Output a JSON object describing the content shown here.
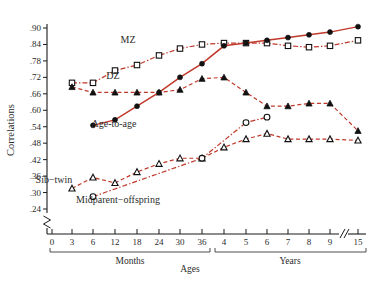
{
  "chart_data": {
    "type": "line",
    "title": "",
    "xlabel": "Ages",
    "ylabel": "Correlations",
    "ylim": [
      0.24,
      0.9
    ],
    "yticks": [
      ".24",
      ".30",
      ".36",
      ".42",
      ".48",
      ".54",
      ".60",
      ".66",
      ".72",
      ".78",
      ".84",
      ".90"
    ],
    "ytick_values": [
      0.24,
      0.3,
      0.36,
      0.42,
      0.48,
      0.54,
      0.6,
      0.66,
      0.72,
      0.78,
      0.84,
      0.9
    ],
    "y_axis_break": true,
    "x_axis_break_before_last": true,
    "grid": false,
    "legend_position": "inline-annotations",
    "xticks": [
      "0",
      "3",
      "6",
      "12",
      "18",
      "24",
      "30",
      "36",
      "4",
      "5",
      "6",
      "7",
      "8",
      "9",
      "15"
    ],
    "x_groups": [
      {
        "label": "Months",
        "ticks": [
          "0",
          "3",
          "6",
          "12",
          "18",
          "24",
          "30",
          "36"
        ]
      },
      {
        "label": "Years",
        "ticks": [
          "4",
          "5",
          "6",
          "7",
          "8",
          "9",
          "15"
        ]
      }
    ],
    "series": [
      {
        "name": "MZ",
        "marker": "open-square",
        "linestyle": "dash-dot",
        "color": "#c0392b",
        "x": [
          "3",
          "6",
          "12",
          "18",
          "24",
          "30",
          "36",
          "4",
          "5",
          "6",
          "7",
          "8",
          "9",
          "15"
        ],
        "values": [
          0.7,
          0.7,
          0.745,
          0.765,
          0.8,
          0.825,
          0.84,
          0.845,
          0.845,
          0.845,
          0.835,
          0.83,
          0.835,
          0.855
        ]
      },
      {
        "name": "DZ",
        "marker": "filled-triangle",
        "linestyle": "dashed",
        "color": "#c0392b",
        "x": [
          "3",
          "6",
          "12",
          "18",
          "24",
          "30",
          "36",
          "4",
          "5",
          "6",
          "7",
          "8",
          "9",
          "15"
        ],
        "values": [
          0.685,
          0.665,
          0.665,
          0.665,
          0.665,
          0.675,
          0.715,
          0.72,
          0.665,
          0.615,
          0.615,
          0.625,
          0.625,
          0.525
        ]
      },
      {
        "name": "Age-to-age",
        "marker": "filled-circle",
        "linestyle": "solid",
        "color": "#c0392b",
        "x": [
          "6",
          "12",
          "18",
          "24",
          "30",
          "36",
          "4",
          "5",
          "6",
          "7",
          "8",
          "9",
          "15"
        ],
        "values": [
          0.545,
          0.565,
          0.615,
          0.665,
          0.72,
          0.77,
          0.835,
          0.845,
          0.855,
          0.865,
          0.875,
          0.885,
          0.905
        ]
      },
      {
        "name": "Sib-twin",
        "marker": "open-triangle",
        "linestyle": "dashed",
        "color": "#c0392b",
        "x": [
          "3",
          "6",
          "12",
          "18",
          "24",
          "30",
          "36",
          "4",
          "5",
          "6",
          "7",
          "8",
          "9",
          "15"
        ],
        "values": [
          0.315,
          0.355,
          0.335,
          0.375,
          0.405,
          0.425,
          0.425,
          0.465,
          0.495,
          0.515,
          0.495,
          0.495,
          0.495,
          0.49
        ]
      },
      {
        "name": "Midparent-offspring",
        "marker": "open-circle",
        "linestyle": "dash-dot",
        "color": "#c0392b",
        "x": [
          "6",
          "36",
          "5",
          "6"
        ],
        "values": [
          0.285,
          0.425,
          0.555,
          0.575
        ]
      }
    ],
    "annotations": [
      {
        "text": "MZ",
        "x": 128,
        "y": 43
      },
      {
        "text": "DZ",
        "x": 113,
        "y": 79
      },
      {
        "text": "Age-to-age",
        "x": 114,
        "y": 127
      },
      {
        "text": "Sib−twin",
        "x": 54,
        "y": 183
      },
      {
        "text": "Midparent−offspring",
        "x": 118,
        "y": 203
      }
    ]
  },
  "colors": {
    "line": "#c0392b",
    "axis": "#1a1a1a",
    "text": "#2b2b2b",
    "background": "#ffffff"
  }
}
